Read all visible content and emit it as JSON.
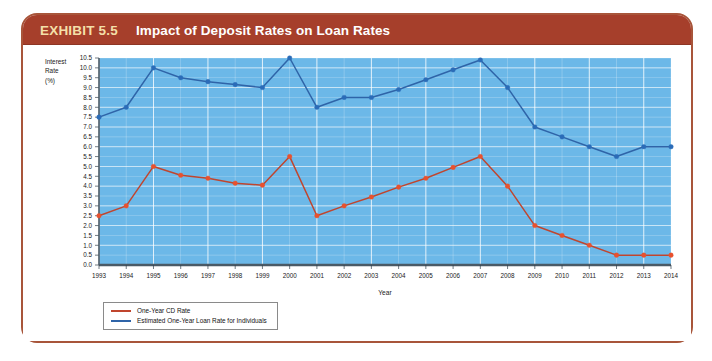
{
  "header": {
    "exhibit_label": "EXHIBIT 5.5",
    "title": "Impact of Deposit Rates on Loan Rates"
  },
  "axis_caption": {
    "line1": "Interest",
    "line2": "Rate",
    "line3": "(%)"
  },
  "colors": {
    "header_bar": "#a63f2b",
    "exhibit_text": "#f4dfa8",
    "frame_border": "#a8553a",
    "plot_background": "#6cb8e8",
    "gridline": "#ffffff",
    "series_cd": "#c0452e",
    "series_loan": "#2f64a8",
    "marker_cd": "#e8512e",
    "marker_loan": "#2b6cb8",
    "axis_line": "#4a5a66"
  },
  "chart_data": {
    "type": "line",
    "title": "Impact of Deposit Rates on Loan Rates",
    "xlabel": "Year",
    "ylabel": "Interest Rate (%)",
    "ylim": [
      0.0,
      10.5
    ],
    "ytick_step": 0.5,
    "grid": true,
    "legend_position": "bottom-left",
    "categories": [
      "1993",
      "1994",
      "1995",
      "1996",
      "1997",
      "1998",
      "1999",
      "2000",
      "2001",
      "2002",
      "2003",
      "2004",
      "2005",
      "2006",
      "2007",
      "2008",
      "2009",
      "2010",
      "2011",
      "2012",
      "2013",
      "2014"
    ],
    "ytick_labels": [
      "0.0",
      "0.5",
      "1.0",
      "1.5",
      "2.0",
      "2.5",
      "3.0",
      "3.5",
      "4.0",
      "4.5",
      "5.0",
      "5.5",
      "6.0",
      "6.5",
      "7.0",
      "7.5",
      "8.0",
      "8.5",
      "9.0",
      "9.5",
      "10.0",
      "10.5"
    ],
    "series": [
      {
        "name": "One-Year CD Rate",
        "color": "#c0452e",
        "values": [
          2.5,
          3.0,
          5.0,
          4.55,
          4.4,
          4.15,
          4.05,
          5.5,
          2.5,
          3.0,
          3.45,
          3.95,
          4.4,
          4.95,
          5.5,
          4.0,
          2.0,
          1.5,
          1.0,
          0.5,
          0.5,
          0.5
        ]
      },
      {
        "name": "Estimated One-Year Loan Rate for Individuals",
        "color": "#2f64a8",
        "values": [
          7.5,
          8.0,
          10.0,
          9.5,
          9.3,
          9.15,
          9.0,
          10.5,
          8.0,
          8.5,
          8.5,
          8.9,
          9.4,
          9.9,
          10.4,
          9.0,
          7.0,
          6.5,
          6.0,
          5.5,
          6.0,
          6.0
        ]
      }
    ]
  },
  "legend": [
    {
      "label": "One-Year CD Rate",
      "color": "#c0452e"
    },
    {
      "label": "Estimated One-Year Loan Rate for Individuals",
      "color": "#2f64a8"
    }
  ]
}
